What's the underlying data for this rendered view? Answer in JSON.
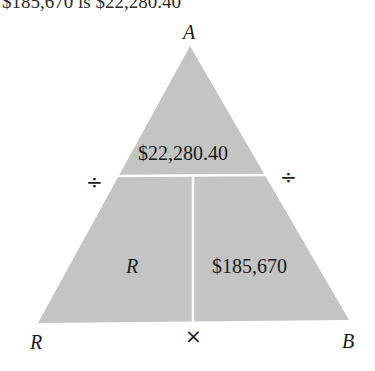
{
  "top_text": "$185,670 is $22,280.40",
  "triangle": {
    "fill_color": "#c4c4c4",
    "divider_color": "#ffffff",
    "top_value": "$22,280.40",
    "bottom_left_value": "R",
    "bottom_right_value": "$185,670"
  },
  "vertices": {
    "top": "A",
    "bottom_left": "R",
    "bottom_right": "B"
  },
  "operators": {
    "left": "÷",
    "right": "÷",
    "bottom": "×"
  }
}
